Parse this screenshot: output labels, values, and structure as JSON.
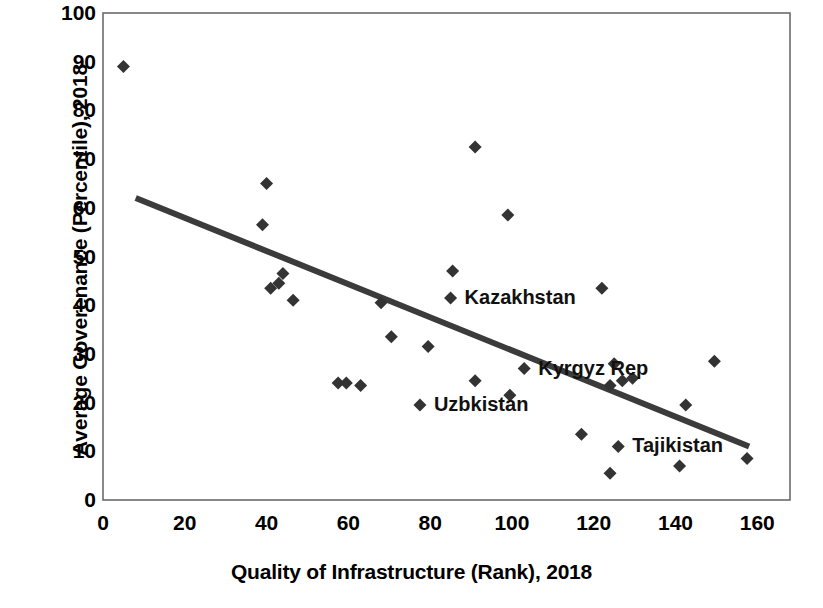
{
  "chart_data": {
    "type": "scatter",
    "title": "",
    "xlabel": "Quality of Infrastructure (Rank), 2018",
    "ylabel": "Average Goverenance (Percentile), 2018",
    "xlim": [
      0,
      168
    ],
    "ylim": [
      0,
      100
    ],
    "xticks": [
      0,
      20,
      40,
      60,
      80,
      100,
      120,
      140,
      160
    ],
    "yticks": [
      0,
      10,
      20,
      30,
      40,
      50,
      60,
      70,
      80,
      90,
      100
    ],
    "grid": false,
    "legend": "none",
    "marker": "diamond",
    "marker_color": "#333333",
    "series": [
      {
        "name": "Countries",
        "points": [
          {
            "x": 5,
            "y": 89
          },
          {
            "x": 40,
            "y": 65
          },
          {
            "x": 39,
            "y": 56.5
          },
          {
            "x": 41,
            "y": 43.5
          },
          {
            "x": 44,
            "y": 46.5
          },
          {
            "x": 43,
            "y": 44.5
          },
          {
            "x": 46.5,
            "y": 41
          },
          {
            "x": 57.5,
            "y": 24
          },
          {
            "x": 59.5,
            "y": 24
          },
          {
            "x": 63,
            "y": 23.5
          },
          {
            "x": 68,
            "y": 40.5
          },
          {
            "x": 70.5,
            "y": 33.5
          },
          {
            "x": 77.5,
            "y": 19.5
          },
          {
            "x": 79.5,
            "y": 31.5
          },
          {
            "x": 85,
            "y": 41.5
          },
          {
            "x": 85.5,
            "y": 47
          },
          {
            "x": 91,
            "y": 72.5
          },
          {
            "x": 91,
            "y": 24.5
          },
          {
            "x": 99,
            "y": 58.5
          },
          {
            "x": 99.5,
            "y": 21.5
          },
          {
            "x": 103,
            "y": 27
          },
          {
            "x": 117,
            "y": 13.5
          },
          {
            "x": 122,
            "y": 43.5
          },
          {
            "x": 124,
            "y": 23.5
          },
          {
            "x": 124,
            "y": 5.5
          },
          {
            "x": 125,
            "y": 28
          },
          {
            "x": 127,
            "y": 24.5
          },
          {
            "x": 129.5,
            "y": 25
          },
          {
            "x": 126,
            "y": 11
          },
          {
            "x": 141,
            "y": 7
          },
          {
            "x": 142.5,
            "y": 19.5
          },
          {
            "x": 149.5,
            "y": 28.5
          },
          {
            "x": 157.5,
            "y": 8.5
          }
        ]
      }
    ],
    "trendline": {
      "type": "linear",
      "x0": 8,
      "y0": 62,
      "x1": 158,
      "y1": 11,
      "color": "#3b3b3b",
      "width": 6
    },
    "annotations": [
      {
        "text": "Kazakhstan",
        "x": 85,
        "y": 41.5,
        "dx": 14,
        "dy": -1
      },
      {
        "text": "Kyrgyz Rep",
        "x": 103,
        "y": 27,
        "dx": 14,
        "dy": -1
      },
      {
        "text": "Uzbkistan",
        "x": 77.5,
        "y": 19.5,
        "dx": 14,
        "dy": -1
      },
      {
        "text": "Tajikistan",
        "x": 126,
        "y": 11,
        "dx": 14,
        "dy": -1
      }
    ]
  },
  "axes": {
    "x_title": "Quality of Infrastructure (Rank), 2018",
    "y_title": "Average Goverenance (Percentile), 2018",
    "x_tick_labels": [
      "0",
      "20",
      "40",
      "60",
      "80",
      "100",
      "120",
      "140",
      "160"
    ],
    "y_tick_labels": [
      "100",
      "90",
      "80",
      "70",
      "60",
      "50",
      "40",
      "30",
      "20",
      "10",
      "0"
    ]
  },
  "labels": {
    "kazakhstan": "Kazakhstan",
    "kyrgyz_rep": "Kyrgyz Rep",
    "uzbkistan": "Uzbkistan",
    "tajikistan": "Tajikistan"
  },
  "colors": {
    "marker": "#333333",
    "trendline": "#3b3b3b",
    "axis": "#6b6b6b",
    "text": "#000000"
  }
}
